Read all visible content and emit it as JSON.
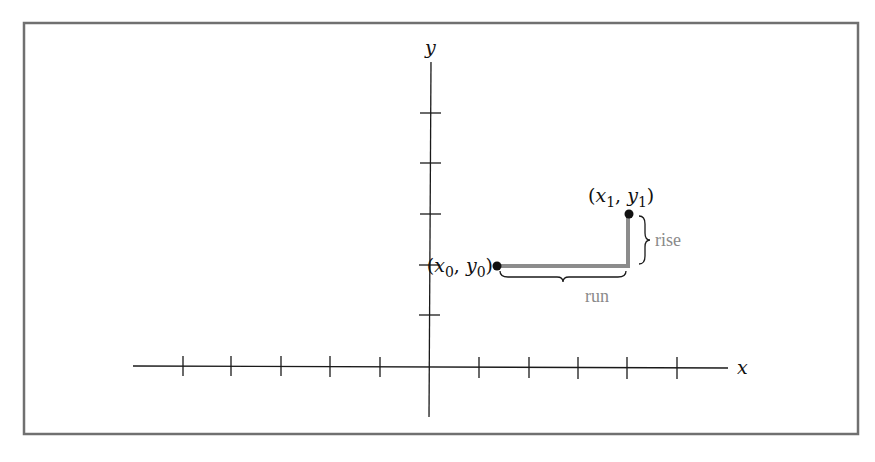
{
  "diagram": {
    "type": "coordinate-plane-slope",
    "frame": {
      "stroke": "#707070"
    },
    "axes": {
      "x_label": "x",
      "y_label": "y",
      "x_ticks_left": 5,
      "x_ticks_right": 5,
      "y_ticks_up": 5,
      "color": "#1a1a1a"
    },
    "points": [
      {
        "label_var": "x",
        "label_sub": "0",
        "label_var2": "y",
        "label_sub2": "0"
      },
      {
        "label_var": "x",
        "label_sub": "1",
        "label_var2": "y",
        "label_sub2": "1"
      }
    ],
    "annotations": {
      "rise_label": "rise",
      "run_label": "run",
      "path_color": "#8c8c8c",
      "label_color": "#8a8a8a"
    }
  }
}
